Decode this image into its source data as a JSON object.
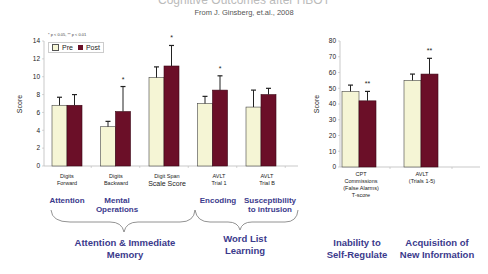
{
  "header": {
    "title": "Cognitive Outcomes after HBOT",
    "subtitle": "From J. Ginsberg, et.al., 2008"
  },
  "significance_note": "* p < 0.05, ** p < 0.01",
  "legend": {
    "pre": "Pre",
    "post": "Post"
  },
  "colors": {
    "pre": "#f5f5d5",
    "post": "#6b0f28",
    "domain_text": "#3b3a8c"
  },
  "labels": {
    "digits_forward_1": "Digits",
    "digits_forward_2": "Forward",
    "digits_backward_1": "Digits",
    "digits_backward_2": "Backward",
    "digit_span": "Digit Span",
    "scale_score": "Scale Score",
    "avlt_trial1_1": "AVLT",
    "avlt_trial1_2": "Trial 1",
    "avlt_trialb_1": "AVLT",
    "avlt_trialb_2": "Trial B",
    "cpt_1": "CPT",
    "cpt_2": "Commissions",
    "cpt_3": "(False Alarms)",
    "cpt_4": "T-score",
    "avlt15_1": "AVLT",
    "avlt15_2": "(Trials 1-5)"
  },
  "domains": {
    "attention": "Attention",
    "mental_ops_1": "Mental",
    "mental_ops_2": "Operations",
    "encoding": "Encoding",
    "suscept_1": "Susceptibility",
    "suscept_2": "to intrusion",
    "attn_mem_1": "Attention & Immediate",
    "attn_mem_2": "Memory",
    "wll_1": "Word List",
    "wll_2": "Learning",
    "self_reg_1": "Inability to",
    "self_reg_2": "Self-Regulate",
    "acq_1": "Acquisition of",
    "acq_2": "New Information"
  },
  "chart_data": [
    {
      "type": "bar",
      "title": "",
      "xlabel": "",
      "ylabel": "Score",
      "ylim": [
        0,
        14
      ],
      "yticks": [
        0,
        2,
        4,
        6,
        8,
        10,
        12,
        14
      ],
      "grid": false,
      "legend_position": "top-left",
      "categories": [
        "Digits Forward",
        "Digits Backward",
        "Digit Span Scale Score",
        "AVLT Trial 1",
        "AVLT Trial B"
      ],
      "series": [
        {
          "name": "Pre",
          "values": [
            6.8,
            4.4,
            9.9,
            7.0,
            6.6
          ],
          "error": [
            0.9,
            0.6,
            1.2,
            0.8,
            1.9
          ]
        },
        {
          "name": "Post",
          "values": [
            6.8,
            6.1,
            11.2,
            8.5,
            8.0
          ],
          "error": [
            1.2,
            2.8,
            2.3,
            1.6,
            0.7
          ]
        }
      ],
      "significance": [
        "",
        "*",
        "*",
        "*",
        ""
      ]
    },
    {
      "type": "bar",
      "title": "",
      "xlabel": "",
      "ylabel": "Score",
      "ylim": [
        0,
        80
      ],
      "yticks": [
        0,
        10,
        20,
        30,
        40,
        50,
        60,
        70,
        80
      ],
      "grid": false,
      "categories": [
        "CPT Commissions (False Alarms) T-score",
        "AVLT (Trials 1-5)"
      ],
      "series": [
        {
          "name": "Pre",
          "values": [
            48,
            55
          ],
          "error": [
            4,
            4
          ]
        },
        {
          "name": "Post",
          "values": [
            42,
            59
          ],
          "error": [
            6,
            10
          ]
        }
      ],
      "significance": [
        "**",
        "**"
      ]
    }
  ]
}
